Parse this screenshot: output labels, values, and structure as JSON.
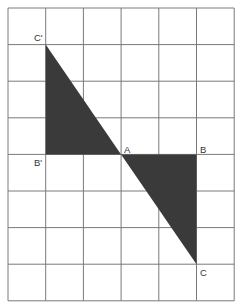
{
  "diagram": {
    "grid": {
      "columns": 6,
      "rows": 8,
      "left": 8,
      "top": 8,
      "cell_width": 37.7,
      "cell_height": 36.6,
      "line_color": "#7a7a7a"
    },
    "fill_color": "#3a3a3a",
    "points": {
      "A": {
        "label": "A",
        "col": 3,
        "row": 4
      },
      "B": {
        "label": "B",
        "col": 5,
        "row": 4
      },
      "C": {
        "label": "C",
        "col": 5,
        "row": 7
      },
      "B_prime": {
        "label": "B'",
        "col": 1,
        "row": 4
      },
      "C_prime": {
        "label": "C'",
        "col": 1,
        "row": 1
      }
    },
    "triangles": [
      {
        "name": "triangle-ABC",
        "vertices": [
          "A",
          "B",
          "C"
        ]
      },
      {
        "name": "triangle-AB'C'",
        "vertices": [
          "A",
          "B_prime",
          "C_prime"
        ]
      }
    ]
  }
}
